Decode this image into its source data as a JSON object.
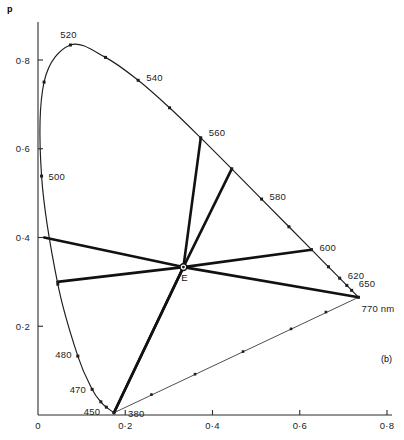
{
  "figure": {
    "panel_label": "(b)",
    "corner_label": "p",
    "white_point_label": "E"
  },
  "chart_data": {
    "type": "line",
    "title": "",
    "subtitle": "",
    "xlabel": "",
    "ylabel": "",
    "xlim": [
      0.0,
      0.85
    ],
    "ylim": [
      0.0,
      0.9
    ],
    "grid": false,
    "legend": null,
    "x_ticks": [
      "0",
      "0·2",
      "0·4",
      "0·6",
      "0·8"
    ],
    "x_tick_values": [
      0.0,
      0.2,
      0.4,
      0.6,
      0.8
    ],
    "y_ticks": [
      "0",
      "0·2",
      "0·4",
      "0·6",
      "0·8"
    ],
    "y_tick_values": [
      0.0,
      0.2,
      0.4,
      0.6,
      0.8
    ],
    "series": [
      {
        "name": "spectral locus",
        "kind": "curve-with-markers",
        "points": [
          {
            "wl": 380,
            "x": 0.1741,
            "y": 0.005,
            "label": "380",
            "marker": true
          },
          {
            "wl": 450,
            "x": 0.1566,
            "y": 0.0177,
            "label": "450",
            "marker": true
          },
          {
            "wl": 460,
            "x": 0.144,
            "y": 0.0297,
            "label": "",
            "marker": true
          },
          {
            "wl": 470,
            "x": 0.1241,
            "y": 0.0578,
            "label": "470",
            "marker": true
          },
          {
            "wl": 480,
            "x": 0.0913,
            "y": 0.1327,
            "label": "480",
            "marker": true
          },
          {
            "wl": 490,
            "x": 0.0454,
            "y": 0.295,
            "label": "",
            "marker": true
          },
          {
            "wl": 500,
            "x": 0.0082,
            "y": 0.5384,
            "label": "500",
            "marker": true
          },
          {
            "wl": 510,
            "x": 0.0139,
            "y": 0.7502,
            "label": "",
            "marker": true
          },
          {
            "wl": 520,
            "x": 0.0743,
            "y": 0.8338,
            "label": "520",
            "marker": true
          },
          {
            "wl": 530,
            "x": 0.1547,
            "y": 0.8059,
            "label": "",
            "marker": true
          },
          {
            "wl": 540,
            "x": 0.2296,
            "y": 0.7543,
            "label": "540",
            "marker": true
          },
          {
            "wl": 550,
            "x": 0.3016,
            "y": 0.6923,
            "label": "",
            "marker": true
          },
          {
            "wl": 560,
            "x": 0.3731,
            "y": 0.6245,
            "label": "560",
            "marker": true
          },
          {
            "wl": 570,
            "x": 0.4441,
            "y": 0.5547,
            "label": "",
            "marker": true
          },
          {
            "wl": 580,
            "x": 0.5125,
            "y": 0.4866,
            "label": "580",
            "marker": true
          },
          {
            "wl": 590,
            "x": 0.5752,
            "y": 0.4242,
            "label": "",
            "marker": true
          },
          {
            "wl": 600,
            "x": 0.627,
            "y": 0.3725,
            "label": "600",
            "marker": true
          },
          {
            "wl": 610,
            "x": 0.6658,
            "y": 0.334,
            "label": "",
            "marker": true
          },
          {
            "wl": 620,
            "x": 0.6915,
            "y": 0.3083,
            "label": "620",
            "marker": true
          },
          {
            "wl": 630,
            "x": 0.7079,
            "y": 0.292,
            "label": "",
            "marker": true
          },
          {
            "wl": 650,
            "x": 0.719,
            "y": 0.2809,
            "label": "650",
            "marker": true
          },
          {
            "wl": 770,
            "x": 0.7347,
            "y": 0.2653,
            "label": "770 nm",
            "marker": true
          }
        ]
      },
      {
        "name": "purple boundary",
        "kind": "dashed-line",
        "from": {
          "x": 0.1741,
          "y": 0.005
        },
        "to": {
          "x": 0.7347,
          "y": 0.2653
        },
        "tick_marks": [
          {
            "x": 0.26,
            "y": 0.046
          },
          {
            "x": 0.36,
            "y": 0.092
          },
          {
            "x": 0.47,
            "y": 0.143
          },
          {
            "x": 0.58,
            "y": 0.194
          },
          {
            "x": 0.66,
            "y": 0.232
          }
        ]
      },
      {
        "name": "complementary chords through E",
        "kind": "chords",
        "white_point": {
          "x": 0.3333,
          "y": 0.3333,
          "label": "E"
        },
        "chords": [
          {
            "a": {
              "x": 0.0143,
              "y": 0.4
            },
            "b": {
              "x": 0.7347,
              "y": 0.2653
            }
          },
          {
            "a": {
              "x": 0.0445,
              "y": 0.3
            },
            "b": {
              "x": 0.627,
              "y": 0.3725
            }
          },
          {
            "a": {
              "x": 0.1741,
              "y": 0.005
            },
            "b": {
              "x": 0.3731,
              "y": 0.6245
            }
          },
          {
            "a": {
              "x": 0.1741,
              "y": 0.005
            },
            "b": {
              "x": 0.4441,
              "y": 0.5547
            }
          }
        ]
      }
    ]
  }
}
